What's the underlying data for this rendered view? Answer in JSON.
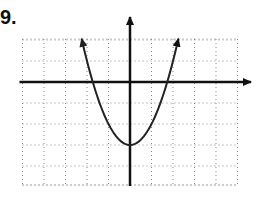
{
  "problem": {
    "number_label": "9."
  },
  "colors": {
    "grid": "#8a8a8a",
    "axis": "#111111",
    "curve": "#222222",
    "background": "#ffffff"
  },
  "chart_data": {
    "type": "line",
    "title": "",
    "xlabel": "",
    "ylabel": "",
    "function": "y = x^2 - 3 (approx.)",
    "xlim": [
      -5,
      5
    ],
    "ylim": [
      -5,
      2
    ],
    "grid": true,
    "grid_style": "dotted",
    "x_ticks_labeled": false,
    "y_ticks_labeled": false,
    "axes_arrows": [
      "positive-x",
      "positive-y"
    ],
    "curve_arrows": [
      "both-ends"
    ],
    "series": [
      {
        "name": "parabola",
        "x": [
          -2.25,
          -2,
          -1.5,
          -1,
          -0.5,
          0,
          0.5,
          1,
          1.5,
          2,
          2.25
        ],
        "y": [
          2.06,
          1,
          -0.75,
          -2,
          -2.75,
          -3,
          -2.75,
          -2,
          -0.75,
          1,
          2.06
        ]
      }
    ],
    "vertex": [
      0,
      -3
    ],
    "legend": null
  }
}
